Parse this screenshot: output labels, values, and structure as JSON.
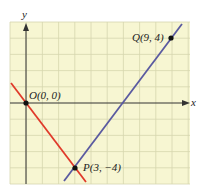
{
  "diagram": {
    "type": "coordinate-plane",
    "axes": {
      "x_label": "x",
      "y_label": "y"
    },
    "grid": {
      "x_range": [
        -1,
        10
      ],
      "y_range": [
        -5,
        5
      ],
      "cell": 1,
      "background": "#f7f6d2",
      "line_color": "#d8d7b0"
    },
    "points": [
      {
        "name": "O",
        "label": "O(0, 0)",
        "x": 0,
        "y": 0
      },
      {
        "name": "P",
        "label": "P(3, −4)",
        "x": 3,
        "y": -4
      },
      {
        "name": "Q",
        "label": "Q(9, 4)",
        "x": 9,
        "y": 4
      }
    ],
    "lines": [
      {
        "name": "line-OP",
        "through": [
          "O",
          "P"
        ],
        "color": "#e03a2a"
      },
      {
        "name": "line-PQ",
        "through": [
          "P",
          "Q"
        ],
        "color": "#5a5aa0"
      }
    ]
  }
}
